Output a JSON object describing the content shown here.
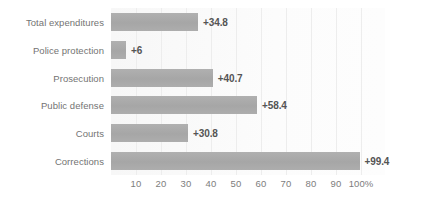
{
  "chart_data": {
    "type": "bar",
    "orientation": "horizontal",
    "title": "",
    "subtitle": "",
    "xlabel": "",
    "ylabel": "",
    "xlim": [
      0,
      110
    ],
    "grid": true,
    "legend": null,
    "axis_unit": "%",
    "categories": [
      "Total expenditures",
      "Police protection",
      "Prosecution",
      "Public defense",
      "Courts",
      "Corrections"
    ],
    "values": [
      34.8,
      6,
      40.7,
      58.4,
      30.8,
      99.4
    ],
    "data_labels": [
      "+34.8",
      "+6",
      "+40.7",
      "+58.4",
      "+30.8",
      "+99.4"
    ],
    "xticks": [
      10,
      20,
      30,
      40,
      50,
      60,
      70,
      80,
      90,
      100
    ],
    "xtick_labels": [
      "10",
      "20",
      "30",
      "40",
      "50",
      "60",
      "70",
      "80",
      "90",
      "100%"
    ],
    "bar_color": "#a9a9a9",
    "grid_color": "#ededed",
    "plot_background": "#fbfbfb",
    "label_color": "#737373",
    "value_label_color": "#545454"
  }
}
